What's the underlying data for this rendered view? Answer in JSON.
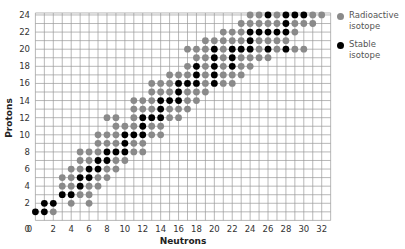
{
  "chart_data": {
    "type": "scatter",
    "title": "",
    "xlabel": "Neutrons",
    "ylabel": "Protons",
    "xlim": [
      0,
      33
    ],
    "ylim": [
      0,
      24
    ],
    "grid": true,
    "x_ticks": [
      0,
      2,
      4,
      6,
      8,
      10,
      12,
      14,
      16,
      18,
      20,
      22,
      24,
      26,
      28,
      30,
      32
    ],
    "y_ticks": [
      0,
      2,
      4,
      6,
      8,
      10,
      12,
      14,
      16,
      18,
      20,
      22,
      24
    ],
    "legend_position": "right",
    "colors": {
      "radioactive": "#8a8a8a",
      "stable": "#000000",
      "grid": "#9a9a9a"
    },
    "series": [
      {
        "name": "Radioactive isotope",
        "key": "radioactive"
      },
      {
        "name": "Stable isotope",
        "key": "stable"
      }
    ],
    "rows": [
      {
        "Z": 1,
        "N_min": 0,
        "N_max": 2,
        "stable": [
          0,
          1
        ]
      },
      {
        "Z": 2,
        "N_min": 1,
        "N_max": 6,
        "stable": [
          1,
          2
        ],
        "missing": [
          3,
          5
        ]
      },
      {
        "Z": 3,
        "N_min": 3,
        "N_max": 6,
        "stable": [
          3,
          4
        ]
      },
      {
        "Z": 4,
        "N_min": 3,
        "N_max": 7,
        "stable": [
          5
        ]
      },
      {
        "Z": 5,
        "N_min": 3,
        "N_max": 8,
        "stable": [
          5,
          6
        ]
      },
      {
        "Z": 6,
        "N_min": 4,
        "N_max": 9,
        "stable": [
          6,
          7
        ]
      },
      {
        "Z": 7,
        "N_min": 5,
        "N_max": 10,
        "stable": [
          7,
          8
        ]
      },
      {
        "Z": 8,
        "N_min": 5,
        "N_max": 12,
        "stable": [
          8,
          9,
          10
        ]
      },
      {
        "Z": 9,
        "N_min": 7,
        "N_max": 12,
        "stable": [
          10
        ]
      },
      {
        "Z": 10,
        "N_min": 7,
        "N_max": 14,
        "stable": [
          10,
          11,
          12
        ]
      },
      {
        "Z": 11,
        "N_min": 9,
        "N_max": 14,
        "stable": [
          12
        ]
      },
      {
        "Z": 12,
        "N_min": 8,
        "N_max": 16,
        "stable": [
          12,
          13,
          14
        ],
        "missing": [
          10
        ]
      },
      {
        "Z": 13,
        "N_min": 11,
        "N_max": 17,
        "stable": [
          14
        ]
      },
      {
        "Z": 14,
        "N_min": 11,
        "N_max": 18,
        "stable": [
          14,
          15,
          16
        ]
      },
      {
        "Z": 15,
        "N_min": 13,
        "N_max": 19,
        "stable": [
          16
        ]
      },
      {
        "Z": 16,
        "N_min": 13,
        "N_max": 22,
        "stable": [
          16,
          17,
          18,
          20
        ]
      },
      {
        "Z": 17,
        "N_min": 15,
        "N_max": 23,
        "stable": [
          18,
          20
        ]
      },
      {
        "Z": 18,
        "N_min": 17,
        "N_max": 24,
        "stable": [
          18,
          20,
          22
        ]
      },
      {
        "Z": 19,
        "N_min": 18,
        "N_max": 26,
        "stable": [
          20,
          22
        ]
      },
      {
        "Z": 20,
        "N_min": 17,
        "N_max": 30,
        "stable": [
          20,
          22,
          23,
          24,
          26,
          28
        ]
      },
      {
        "Z": 21,
        "N_min": 19,
        "N_max": 28,
        "stable": [
          24
        ]
      },
      {
        "Z": 22,
        "N_min": 21,
        "N_max": 29,
        "stable": [
          24,
          25,
          26,
          27,
          28
        ]
      },
      {
        "Z": 23,
        "N_min": 23,
        "N_max": 31,
        "stable": [
          28
        ]
      },
      {
        "Z": 24,
        "N_min": 24,
        "N_max": 32,
        "stable": [
          26,
          28,
          29,
          30
        ]
      }
    ]
  },
  "legend": {
    "radioactive": [
      "Radioactive",
      "isotope"
    ],
    "stable": [
      "Stable",
      "isotope"
    ]
  }
}
